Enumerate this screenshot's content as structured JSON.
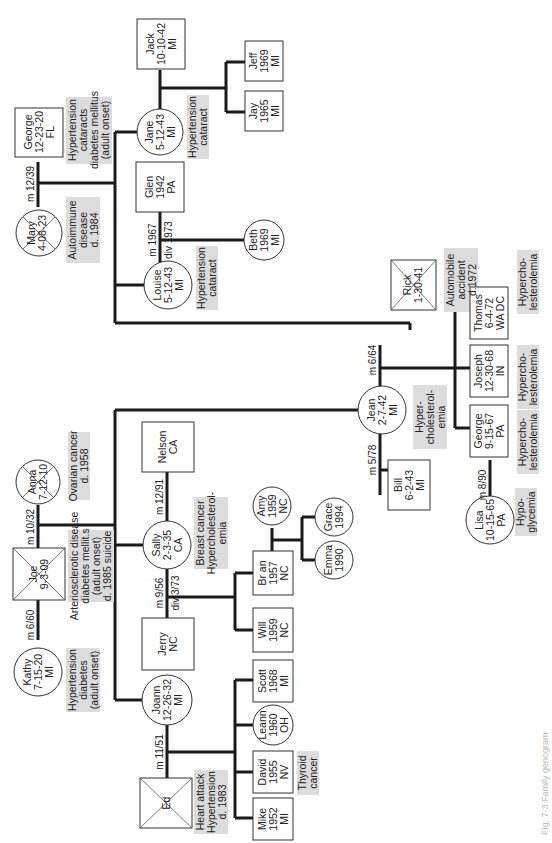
{
  "people": {
    "george_sr": {
      "lines": [
        "George",
        "12-23-20",
        "FL"
      ]
    },
    "mary": {
      "lines": [
        "Mary",
        "4-08-23"
      ]
    },
    "jack": {
      "lines": [
        "Jack",
        "10-10-42",
        "MI"
      ]
    },
    "jane": {
      "lines": [
        "Jane",
        "5-12-43",
        "MI"
      ]
    },
    "jeff": {
      "lines": [
        "Jeff",
        "1969",
        "MI"
      ]
    },
    "jay": {
      "lines": [
        "Jay",
        "1965",
        "MI"
      ]
    },
    "glen": {
      "lines": [
        "Glen",
        "1942",
        "PA"
      ]
    },
    "louise": {
      "lines": [
        "Louise",
        "5-12-43",
        "MI"
      ]
    },
    "beth": {
      "lines": [
        "Beth",
        "1969",
        "MI"
      ]
    },
    "rick": {
      "lines": [
        "Rick",
        "1-30-41"
      ]
    },
    "thomas": {
      "lines": [
        "Thomas",
        "6-4-72",
        "WA DC"
      ]
    },
    "joseph": {
      "lines": [
        "Joseph",
        "12-30-68",
        "IN"
      ]
    },
    "george_jr": {
      "lines": [
        "George",
        "9-15-67",
        "PA"
      ]
    },
    "jean": {
      "lines": [
        "Jean",
        "2-7-42",
        "MI"
      ]
    },
    "bill": {
      "lines": [
        "Bill",
        "6-2-43",
        "MI"
      ]
    },
    "lisa": {
      "lines": [
        "Lisa",
        "10-15-65",
        "PA"
      ]
    },
    "anna": {
      "lines": [
        "Anna",
        "7-12-10"
      ]
    },
    "joe": {
      "lines": [
        "Joe",
        "9-3-09"
      ]
    },
    "kathy": {
      "lines": [
        "Kathy",
        "7-15-20",
        "MI"
      ]
    },
    "nelson": {
      "lines": [
        "Nelson",
        "CA"
      ]
    },
    "sally": {
      "lines": [
        "Sally",
        "2-3-35",
        "CA"
      ]
    },
    "amy": {
      "lines": [
        "Amy",
        "1959",
        "NC"
      ]
    },
    "grace": {
      "lines": [
        "Grace",
        "1994"
      ]
    },
    "emma": {
      "lines": [
        "Emma",
        "1990"
      ]
    },
    "brian": {
      "lines": [
        "Br an",
        "1957",
        "NC"
      ]
    },
    "will": {
      "lines": [
        "Will",
        "1959",
        "NC"
      ]
    },
    "jerry": {
      "lines": [
        "Jerry",
        "NC"
      ]
    },
    "joann": {
      "lines": [
        "Joann",
        "12-26-32",
        "MI"
      ]
    },
    "ed": {
      "lines": [
        "Ed"
      ]
    },
    "scott": {
      "lines": [
        "Scott",
        "1968",
        "MI"
      ]
    },
    "leann": {
      "lines": [
        "Leann",
        "1960",
        "OH"
      ]
    },
    "david": {
      "lines": [
        "David",
        "1955",
        "NV"
      ]
    },
    "mike": {
      "lines": [
        "Mike",
        "1952",
        "MI"
      ]
    }
  },
  "notes": {
    "george_sr": [
      "Hypertension",
      "cataracts",
      "diabetes mellitus",
      "(adult onset)"
    ],
    "mary": [
      "Autoimmune",
      "disease",
      "d. 1984"
    ],
    "jane": [
      "Hypertension",
      "cataract"
    ],
    "louise": [
      "Hypertension",
      "cataract"
    ],
    "rick": [
      "Automobile",
      "accident",
      "d.1972"
    ],
    "thomas": [
      "Hypercho-",
      "lesterolemia"
    ],
    "joseph": [
      "Hypercho-",
      "lesterolemia"
    ],
    "george_jr": [
      "Hypercho-",
      "lesterolemia"
    ],
    "jean": [
      "Hyper-",
      "cholesterol-",
      "emia"
    ],
    "lisa": [
      "Hypo-",
      "glycemia"
    ],
    "anna": [
      "Ovarian cancer",
      "d. 1958"
    ],
    "joe": [
      "Arteriosclerotic disease",
      "diabetes mellit.s",
      "(adult onset)",
      "d. 1985 suicide"
    ],
    "sally": [
      "Breast cancer",
      "Hypercholesterol-",
      "emia"
    ],
    "kathy": [
      "Hypertension",
      "diabetes",
      "(adult onset)"
    ],
    "ed": [
      "Heart attack",
      "Hypertension",
      "d. 1983"
    ],
    "david": [
      "Thyroid",
      "cancer"
    ]
  },
  "relations": {
    "george_mary": "m 12/39",
    "glen_louise_m": "m 1967",
    "glen_louise_div": "div 1973",
    "jean_rick": "m 6/64",
    "jean_bill": "m 5/78",
    "george_lisa": "m 8/90",
    "joe_anna": "m 10/32",
    "joe_kathy": "m 6/60",
    "sally_nelson": "m 12/91",
    "sally_jerry_m": "m 9/56",
    "sally_jerry_div": "div 3/73",
    "joann_ed": "m 11/51"
  },
  "caption": "Fig. 7-3 Family genogram"
}
